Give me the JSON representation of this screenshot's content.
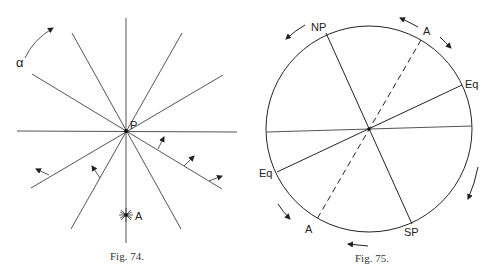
{
  "figures": [
    {
      "id": "fig74",
      "caption": "Fig. 74.",
      "labels": {
        "alpha": "α",
        "point_p": "P",
        "point_a": "A"
      }
    },
    {
      "id": "fig75",
      "caption": "Fig. 75.",
      "labels": {
        "north_pole": "NP",
        "south_pole": "SP",
        "equator_right": "Eq",
        "equator_left": "Eq",
        "axis_top": "A",
        "axis_bottom": "A"
      }
    }
  ]
}
